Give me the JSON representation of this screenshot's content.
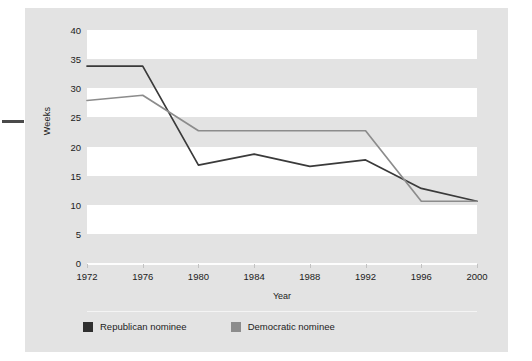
{
  "figure": {
    "panel_bg": "#e3e3e3",
    "band_color": "#ffffff"
  },
  "chart_data": {
    "type": "line",
    "title": "",
    "subtitle": "",
    "xlabel": "Year",
    "ylabel": "Weeks",
    "categories": [
      "1972",
      "1976",
      "1980",
      "1984",
      "1988",
      "1992",
      "1996",
      "2000"
    ],
    "x": [
      1972,
      1976,
      1980,
      1984,
      1988,
      1992,
      1996,
      2000
    ],
    "xlim": [
      1972,
      2000
    ],
    "ylim": [
      0,
      40
    ],
    "yticks": [
      "0",
      "5",
      "10",
      "15",
      "20",
      "25",
      "30",
      "35",
      "40"
    ],
    "ytick_values": [
      0,
      5,
      10,
      15,
      20,
      25,
      30,
      35,
      40
    ],
    "grid": "horizontal-alternating-bands",
    "legend_position": "bottom-left",
    "series": [
      {
        "name": "Republican nominee",
        "color": "#3a3a3a",
        "values": [
          33.8,
          33.8,
          16.8,
          18.7,
          16.6,
          17.7,
          12.8,
          10.6
        ]
      },
      {
        "name": "Democratic nominee",
        "color": "#8c8c8c",
        "values": [
          27.9,
          28.8,
          22.7,
          22.7,
          22.7,
          22.7,
          10.6,
          10.6
        ]
      }
    ]
  },
  "legend": {
    "items": [
      {
        "label": "Republican nominee",
        "color": "#2f2f2f"
      },
      {
        "label": "Democratic nominee",
        "color": "#8c8c8c"
      }
    ]
  }
}
